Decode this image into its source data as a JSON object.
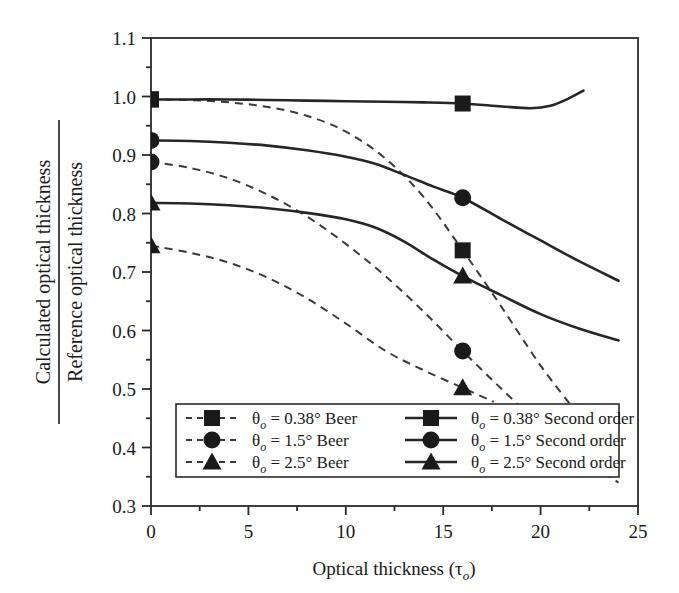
{
  "chart_data": {
    "type": "line",
    "title": "",
    "xlabel": "Optical thickness (τₒ)",
    "xlabel_main": "Optical thickness (",
    "xlabel_sym": "τ",
    "xlabel_sub": "o",
    "xlabel_close": ")",
    "ylabel_numerator": "Calculated optical thickness",
    "ylabel_denominator": "Reference optical thickness",
    "xlim": [
      0,
      25
    ],
    "ylim": [
      0.3,
      1.1
    ],
    "xticks": [
      0,
      5,
      10,
      15,
      20,
      25
    ],
    "xtick_labels": [
      "0",
      "5",
      "10",
      "15",
      "20",
      "25"
    ],
    "yticks": [
      0.3,
      0.4,
      0.5,
      0.6,
      0.7,
      0.8,
      0.9,
      1.0,
      1.1
    ],
    "ytick_labels": [
      "0.3",
      "0.4",
      "0.5",
      "0.6",
      "0.7",
      "0.8",
      "0.9",
      "1.0",
      "1.1"
    ],
    "x_minor_tick_step": 2.5,
    "y_minor_tick_step": 0.05,
    "grid": false,
    "legend_position": "lower-center",
    "series": [
      {
        "name": "θo = 0.38° Beer",
        "style": "dashed",
        "marker": "square",
        "x": [
          0,
          2,
          4,
          6,
          8,
          10,
          12,
          14,
          16,
          18,
          20,
          21.8
        ],
        "y": [
          0.995,
          0.994,
          0.99,
          0.982,
          0.967,
          0.94,
          0.895,
          0.828,
          0.737,
          0.64,
          0.54,
          0.462
        ],
        "marker_points": [
          [
            0,
            0.995
          ],
          [
            16,
            0.737
          ]
        ]
      },
      {
        "name": "θo = 1.5° Beer",
        "style": "dashed",
        "marker": "circle",
        "x": [
          0,
          2,
          4,
          6,
          8,
          10,
          12,
          14,
          16,
          18,
          20,
          22,
          24
        ],
        "y": [
          0.888,
          0.878,
          0.86,
          0.832,
          0.795,
          0.748,
          0.694,
          0.632,
          0.565,
          0.5,
          0.438,
          0.385,
          0.34
        ],
        "marker_points": [
          [
            0,
            0.888
          ],
          [
            16,
            0.565
          ]
        ]
      },
      {
        "name": "θo = 2.5° Beer",
        "style": "dashed",
        "marker": "triangle",
        "x": [
          0,
          2,
          4,
          6,
          8,
          10,
          12,
          14,
          16,
          17.6
        ],
        "y": [
          0.745,
          0.733,
          0.716,
          0.69,
          0.655,
          0.612,
          0.566,
          0.532,
          0.502,
          0.478
        ],
        "marker_points": [
          [
            0,
            0.745
          ],
          [
            16,
            0.502
          ]
        ]
      },
      {
        "name": "θo = 0.38° Second order",
        "style": "solid",
        "marker": "square",
        "x": [
          0,
          2,
          4,
          6,
          8,
          10,
          12,
          14,
          16,
          18,
          19.5,
          20.5,
          21.4,
          22.2
        ],
        "y": [
          0.995,
          0.995,
          0.995,
          0.994,
          0.993,
          0.992,
          0.991,
          0.99,
          0.988,
          0.983,
          0.98,
          0.984,
          0.996,
          1.01
        ],
        "marker_points": [
          [
            0,
            0.995
          ],
          [
            16,
            0.988
          ]
        ]
      },
      {
        "name": "θo = 1.5° Second order",
        "style": "solid",
        "marker": "circle",
        "x": [
          0,
          2,
          4,
          6,
          8,
          10,
          11.5,
          13,
          14.5,
          16,
          18,
          20,
          22,
          24
        ],
        "y": [
          0.925,
          0.924,
          0.921,
          0.916,
          0.908,
          0.897,
          0.885,
          0.866,
          0.846,
          0.827,
          0.79,
          0.754,
          0.718,
          0.685
        ],
        "marker_points": [
          [
            0,
            0.925
          ],
          [
            16,
            0.827
          ]
        ]
      },
      {
        "name": "θo = 2.5° Second order",
        "style": "solid",
        "marker": "triangle",
        "x": [
          0,
          2,
          4,
          6,
          8,
          10,
          11.5,
          13,
          14.5,
          16,
          18,
          20,
          22,
          24
        ],
        "y": [
          0.818,
          0.817,
          0.814,
          0.809,
          0.801,
          0.79,
          0.776,
          0.752,
          0.721,
          0.693,
          0.66,
          0.628,
          0.603,
          0.583
        ],
        "marker_points": [
          [
            0,
            0.818
          ],
          [
            16,
            0.693
          ]
        ]
      }
    ]
  },
  "legend": {
    "entries": [
      {
        "style": "dashed",
        "marker": "square",
        "sym": "θ",
        "sub": "o",
        "text": " = 0.38° Beer"
      },
      {
        "style": "dashed",
        "marker": "circle",
        "sym": "θ",
        "sub": "o",
        "text": " = 1.5° Beer"
      },
      {
        "style": "dashed",
        "marker": "triangle",
        "sym": "θ",
        "sub": "o",
        "text": " = 2.5° Beer"
      },
      {
        "style": "solid",
        "marker": "square",
        "sym": "θ",
        "sub": "o",
        "text": " = 0.38° Second order"
      },
      {
        "style": "solid",
        "marker": "circle",
        "sym": "θ",
        "sub": "o",
        "text": " = 1.5° Second order"
      },
      {
        "style": "solid",
        "marker": "triangle",
        "sym": "θ",
        "sub": "o",
        "text": " = 2.5° Second order"
      }
    ]
  },
  "colors": {
    "axis": "#2a2a2a",
    "solid_curve": "#262626",
    "dashed_curve": "#3a3a3a",
    "marker": "#1a1a1a",
    "background": "#ffffff"
  }
}
